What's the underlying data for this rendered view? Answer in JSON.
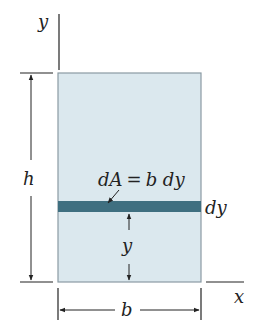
{
  "diagram": {
    "axes": {
      "x_label": "x",
      "y_label": "y"
    },
    "rectangle": {
      "fill": "#dbe8ee",
      "stroke": "#8a9aa3"
    },
    "strip": {
      "fill": "#3f6f80",
      "label_equation_lhs": "dA",
      "label_equals": "=",
      "label_equation_rhs": "b dy",
      "thickness_label": "dy"
    },
    "dimensions": {
      "height_label": "h",
      "width_label": "b",
      "strip_offset_label": "y"
    },
    "line_color": "#222222"
  }
}
